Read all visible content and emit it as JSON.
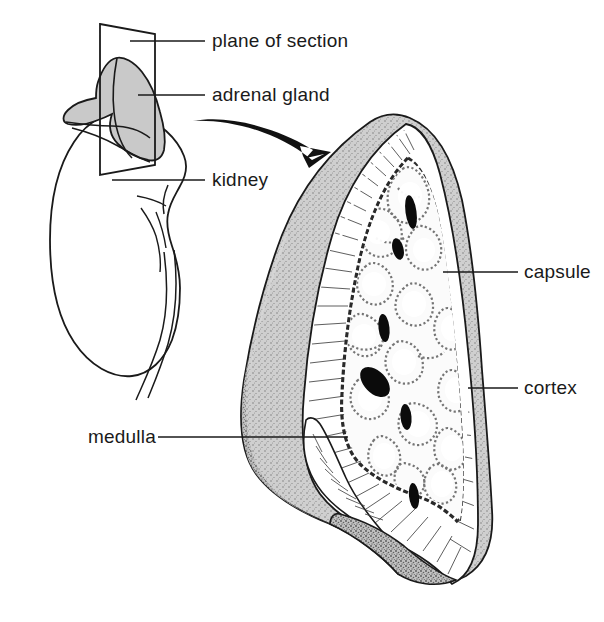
{
  "figure": {
    "background_color": "#ffffff",
    "ink_color": "#1a1a1a",
    "gray_fill": "#c9c9c9",
    "light_fill": "#e8e8e8",
    "width": 604,
    "height": 622
  },
  "labels": {
    "plane_of_section": "plane of section",
    "adrenal_gland": "adrenal gland",
    "kidney": "kidney",
    "capsule": "capsule",
    "cortex": "cortex",
    "medulla": "medulla"
  },
  "structures": {
    "overview": {
      "name": "kidney-with-adrenal-overview",
      "parts": [
        "kidney",
        "adrenal gland",
        "plane of section",
        "ureter",
        "renal vessels"
      ]
    },
    "section": {
      "name": "adrenal-gland-cross-section",
      "parts": [
        "capsule",
        "cortex",
        "medulla",
        "central vein",
        "blood vessels"
      ]
    },
    "arrow": {
      "name": "magnification-arrow",
      "direction": "down-right"
    }
  }
}
